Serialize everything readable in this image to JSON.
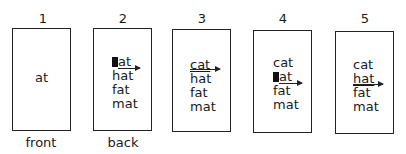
{
  "cards": [
    {
      "number": "1",
      "caption": "front",
      "words": [
        "at"
      ]
    },
    {
      "number": "2",
      "caption": "back",
      "words": [
        "at",
        "hat",
        "fat",
        "mat"
      ],
      "blank_first_letter_row": 0,
      "arrow_row": 0
    },
    {
      "number": "3",
      "caption": "",
      "words": [
        "cat",
        "hat",
        "fat",
        "mat"
      ],
      "underlined_row": 0,
      "arrow_row": 0
    },
    {
      "number": "4",
      "caption": "",
      "words": [
        "cat",
        "at",
        "fat",
        "mat"
      ],
      "blank_first_letter_row": 1,
      "arrow_row": 1
    },
    {
      "number": "5",
      "caption": "",
      "words": [
        "cat",
        "hat",
        "fat",
        "mat"
      ],
      "underlined_row": 1,
      "arrow_row": 1
    }
  ]
}
